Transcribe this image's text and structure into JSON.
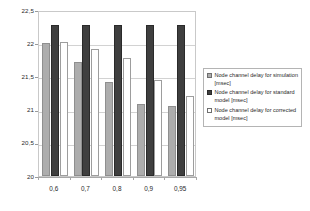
{
  "chart_data": {
    "type": "bar",
    "title": "",
    "xlabel": "",
    "ylabel": "",
    "ylim": [
      20,
      22.5
    ],
    "ytick_labels": [
      "22,5",
      "22",
      "21,5",
      "21",
      "20,5",
      "20"
    ],
    "ytick_values": [
      22.5,
      22,
      21.5,
      21,
      20.5,
      20
    ],
    "grid": true,
    "legend_position": "right",
    "categories": [
      "0,6",
      "0,7",
      "0,8",
      "0,9",
      "0,95"
    ],
    "series": [
      {
        "name": "Node channel delay for simulation [msec]",
        "swatch": "series-sim",
        "color": "#adadad",
        "values": [
          22.0,
          21.72,
          21.42,
          21.08,
          21.06
        ]
      },
      {
        "name": "Node channel delay for standard model [msec]",
        "swatch": "series-standard",
        "color": "#3f3f3f",
        "values": [
          22.28,
          22.28,
          22.28,
          22.28,
          22.28
        ]
      },
      {
        "name": "Node channel delay for corrected model [msec]",
        "swatch": "series-corrected",
        "color": "#ffffff",
        "values": [
          22.02,
          21.92,
          21.78,
          21.45,
          21.2
        ]
      }
    ]
  },
  "legend": {
    "items": [
      {
        "label": "Node channel delay for simulation [msec]",
        "swatch": "series-sim"
      },
      {
        "label": "Node channel delay for standard model [msec]",
        "swatch": "series-standard"
      },
      {
        "label": "Node channel delay for corrected model [msec]",
        "swatch": "series-corrected"
      }
    ]
  }
}
